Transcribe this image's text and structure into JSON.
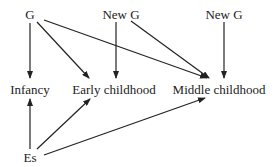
{
  "diagram": {
    "nodes": [
      {
        "id": "g",
        "label": "G",
        "x": 30,
        "y": 14
      },
      {
        "id": "newg1",
        "label": "New G",
        "x": 121,
        "y": 14
      },
      {
        "id": "newg2",
        "label": "New G",
        "x": 224,
        "y": 14
      },
      {
        "id": "infancy",
        "label": "Infancy",
        "x": 30,
        "y": 89
      },
      {
        "id": "early",
        "label": "Early childhood",
        "x": 114,
        "y": 89
      },
      {
        "id": "middle",
        "label": "Middle childhood",
        "x": 219,
        "y": 89
      },
      {
        "id": "es",
        "label": "Es",
        "x": 30,
        "y": 157
      }
    ],
    "edges": [
      {
        "from": "G",
        "to": "Infancy"
      },
      {
        "from": "G",
        "to": "Early childhood"
      },
      {
        "from": "G",
        "to": "Middle childhood"
      },
      {
        "from": "New G",
        "to": "Early childhood"
      },
      {
        "from": "New G",
        "to": "Middle childhood"
      },
      {
        "from": "New G (2)",
        "to": "Middle childhood"
      },
      {
        "from": "Es",
        "to": "Infancy"
      },
      {
        "from": "Es",
        "to": "Early childhood"
      },
      {
        "from": "Es",
        "to": "Middle childhood"
      }
    ],
    "colors": {
      "line": "#222222",
      "text": "#222222",
      "background": "#ffffff"
    }
  }
}
